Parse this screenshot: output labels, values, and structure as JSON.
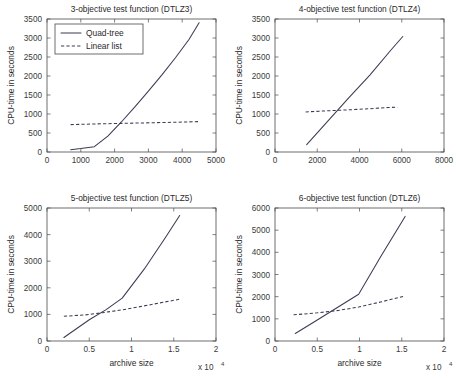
{
  "figure": {
    "background": "#ffffff",
    "line_color": "#3b3b55",
    "axis_color": "#4a4a4a",
    "width": 456,
    "height": 378
  },
  "legend": {
    "position": "upper-left of first subplot",
    "entries": [
      {
        "label": "Quad-tree",
        "style": "solid"
      },
      {
        "label": "Linear list",
        "style": "dashed"
      }
    ]
  },
  "chart_data": [
    {
      "id": "dtlz3",
      "type": "line",
      "title": "3-objective test function (DTLZ3)",
      "xlabel": "",
      "ylabel": "CPU-time in seconds",
      "xlim": [
        0,
        5000
      ],
      "ylim": [
        0,
        3500
      ],
      "xticks": [
        0,
        1000,
        2000,
        3000,
        4000,
        5000
      ],
      "xticklabels": [
        "0",
        "1000",
        "2000",
        "3000",
        "4000",
        "5000"
      ],
      "yticks": [
        0,
        500,
        1000,
        1500,
        2000,
        2500,
        3000,
        3500
      ],
      "yticklabels": [
        "0",
        "500",
        "1000",
        "1500",
        "2000",
        "2500",
        "3000",
        "3500"
      ],
      "x_exponent": "",
      "grid": false,
      "series": [
        {
          "name": "Quad-tree",
          "style": "solid",
          "x": [
            700,
            1000,
            1400,
            1800,
            2200,
            2600,
            3000,
            3400,
            3800,
            4200,
            4500
          ],
          "y": [
            60,
            90,
            140,
            420,
            790,
            1190,
            1600,
            2030,
            2480,
            2960,
            3400
          ]
        },
        {
          "name": "Linear list",
          "style": "dashed",
          "x": [
            700,
            1500,
            2300,
            3100,
            3900,
            4500
          ],
          "y": [
            720,
            740,
            755,
            770,
            785,
            800
          ]
        }
      ]
    },
    {
      "id": "dtlz4",
      "type": "line",
      "title": "4-objective test function (DTLZ4)",
      "xlabel": "",
      "ylabel": "CPU-time in seconds",
      "xlim": [
        0,
        8000
      ],
      "ylim": [
        0,
        3500
      ],
      "xticks": [
        0,
        2000,
        4000,
        6000,
        8000
      ],
      "xticklabels": [
        "0",
        "2000",
        "4000",
        "6000",
        "8000"
      ],
      "yticks": [
        0,
        500,
        1000,
        1500,
        2000,
        2500,
        3000,
        3500
      ],
      "yticklabels": [
        "0",
        "500",
        "1000",
        "1500",
        "2000",
        "2500",
        "3000",
        "3500"
      ],
      "x_exponent": "",
      "grid": false,
      "series": [
        {
          "name": "Quad-tree",
          "style": "solid",
          "x": [
            1500,
            2500,
            3500,
            4500,
            5500,
            6050
          ],
          "y": [
            195,
            810,
            1430,
            2030,
            2690,
            3040
          ]
        },
        {
          "name": "Linear list",
          "style": "dashed",
          "x": [
            1450,
            2500,
            3500,
            4500,
            5350,
            5800
          ],
          "y": [
            1055,
            1085,
            1110,
            1140,
            1170,
            1180
          ]
        }
      ]
    },
    {
      "id": "dtlz5",
      "type": "line",
      "title": "5-objective test function (DTLZ5)",
      "xlabel": "archive size",
      "ylabel": "CPU-time in seconds",
      "xlim": [
        0,
        20000
      ],
      "ylim": [
        0,
        5000
      ],
      "xticks": [
        0,
        5000,
        10000,
        15000,
        20000
      ],
      "xticklabels": [
        "0",
        "0.5",
        "1",
        "1.5",
        "2"
      ],
      "yticks": [
        0,
        1000,
        2000,
        3000,
        4000,
        5000
      ],
      "yticklabels": [
        "0",
        "1000",
        "2000",
        "3000",
        "4000",
        "5000"
      ],
      "x_exponent": "x 10",
      "x_exponent_power": "4",
      "grid": false,
      "series": [
        {
          "name": "Quad-tree",
          "style": "solid",
          "x": [
            2000,
            5000,
            7000,
            8900,
            11500,
            14000,
            15700
          ],
          "y": [
            130,
            800,
            1180,
            1610,
            2700,
            3880,
            4720
          ]
        },
        {
          "name": "Linear list",
          "style": "dashed",
          "x": [
            2000,
            4500,
            6500,
            8900,
            11500,
            14000,
            15700
          ],
          "y": [
            930,
            980,
            1060,
            1170,
            1320,
            1470,
            1570
          ]
        }
      ]
    },
    {
      "id": "dtlz6",
      "type": "line",
      "title": "6-objective test function (DTLZ6)",
      "xlabel": "archive size",
      "ylabel": "CPU-time in seconds",
      "xlim": [
        0,
        20000
      ],
      "ylim": [
        0,
        6000
      ],
      "xticks": [
        0,
        5000,
        10000,
        15000,
        20000
      ],
      "xticklabels": [
        "0",
        "0.5",
        "1",
        "1.5",
        "2"
      ],
      "yticks": [
        0,
        1000,
        2000,
        3000,
        4000,
        5000,
        6000
      ],
      "yticklabels": [
        "0",
        "1000",
        "2000",
        "3000",
        "4000",
        "5000",
        "6000"
      ],
      "x_exponent": "x 10",
      "x_exponent_power": "4",
      "grid": false,
      "series": [
        {
          "name": "Quad-tree",
          "style": "solid",
          "x": [
            2400,
            5000,
            7000,
            9900,
            12500,
            15400
          ],
          "y": [
            340,
            950,
            1420,
            2110,
            3800,
            5620
          ]
        },
        {
          "name": "Linear list",
          "style": "dashed",
          "x": [
            2200,
            5000,
            7500,
            9900,
            12500,
            15400
          ],
          "y": [
            1180,
            1270,
            1380,
            1530,
            1760,
            2030
          ]
        }
      ]
    }
  ]
}
